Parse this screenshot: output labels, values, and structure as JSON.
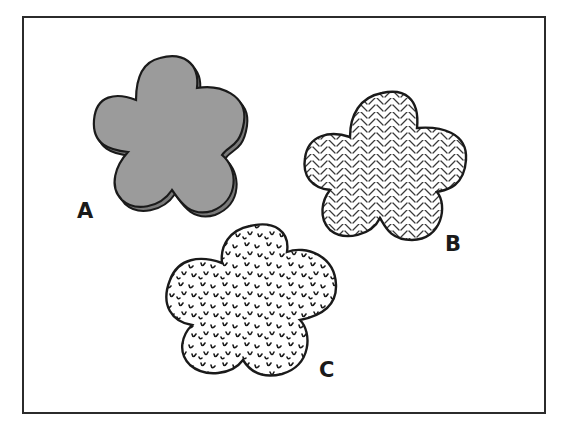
{
  "figure": {
    "colors": {
      "background": "#ffffff",
      "frame": "#2b2b2b",
      "outline": "#1a1a1a",
      "solid_fill": "#9b9b9b",
      "hatch": "#3a3a3a"
    },
    "shapes": [
      {
        "id": "A",
        "label": "A",
        "fill": "solid-gray-with-offset-shadow"
      },
      {
        "id": "B",
        "label": "B",
        "fill": "herringbone-hatch"
      },
      {
        "id": "C",
        "label": "C",
        "fill": "u-shaped-stipple"
      }
    ]
  }
}
